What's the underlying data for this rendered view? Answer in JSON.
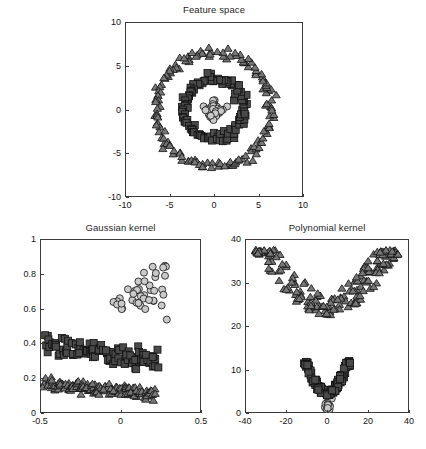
{
  "figure": {
    "width": 426,
    "height": 449,
    "background": "#ffffff"
  },
  "style": {
    "circle_fill": "#c9c9c9",
    "square_fill": "#4a4a4a",
    "triangle_fill": "#777777",
    "marker_edge": "#111111",
    "axis_color": "#3a3a3a",
    "text_color": "#141414"
  },
  "chart_data": [
    {
      "id": "feature-space",
      "type": "scatter",
      "title": "Feature space",
      "xlabel": "",
      "ylabel": "",
      "xlim": [
        -10,
        10
      ],
      "ylim": [
        -10,
        10
      ],
      "xticks": [
        -10,
        -5,
        0,
        5,
        10
      ],
      "yticks": [
        -10,
        -5,
        0,
        5,
        10
      ],
      "xticklabels": [
        "-10",
        "-5",
        "0",
        "5",
        "10"
      ],
      "yticklabels": [
        "-10",
        "-5",
        "0",
        "5",
        "10"
      ],
      "grid": false,
      "legend": "none",
      "description": "Three concentric ring clusters in 2-D feature space: an inner disc of circles, a middle annulus of squares, and an outer annulus of triangles.",
      "series": [
        {
          "name": "class-1",
          "marker": "circle",
          "fill": "#c9c9c9",
          "n": 40,
          "shape": "disc",
          "center": [
            0,
            0
          ],
          "radius_mean": 0.95,
          "radius_spread": 0.75,
          "seed": 11
        },
        {
          "name": "class-2",
          "marker": "square",
          "fill": "#4a4a4a",
          "n": 110,
          "shape": "ring",
          "center": [
            0,
            0
          ],
          "radius_mean": 3.4,
          "radius_spread": 0.55,
          "seed": 27
        },
        {
          "name": "class-3",
          "marker": "triangle",
          "fill": "#777777",
          "n": 150,
          "shape": "ring",
          "center": [
            0,
            0
          ],
          "radius_mean": 6.5,
          "radius_spread": 0.55,
          "seed": 43
        }
      ]
    },
    {
      "id": "gaussian-kernel",
      "type": "scatter",
      "title": "Gaussian kernel",
      "xlabel": "",
      "ylabel": "",
      "xlim": [
        -0.5,
        0.5
      ],
      "ylim": [
        0,
        1
      ],
      "xticks": [
        -0.5,
        0,
        0.5
      ],
      "yticks": [
        0,
        0.2,
        0.4,
        0.6,
        0.8,
        1
      ],
      "xticklabels": [
        "-0.5",
        "0",
        "0.5"
      ],
      "yticklabels": [
        "0",
        "0.2",
        "0.4",
        "0.6",
        "0.8",
        "1"
      ],
      "grid": false,
      "legend": "none",
      "description": "Kernel PCA projection with a Gaussian (RBF) kernel. The three classes separate into three horizontal bands: circles high (around 0.6-0.85) forming a fan, squares in a mid band (around 0.3-0.4), triangles in a low band (around 0.1-0.17).",
      "series": [
        {
          "name": "class-1",
          "marker": "circle",
          "fill": "#c9c9c9",
          "n": 40,
          "shape": "fan",
          "x_range": [
            -0.09,
            0.29
          ],
          "y_base": 0.595,
          "y_slope": 0.62,
          "y_jitter": 0.045,
          "seed": 5
        },
        {
          "name": "class-2",
          "marker": "square",
          "fill": "#4a4a4a",
          "n": 110,
          "shape": "band",
          "x_range": [
            -0.47,
            0.23
          ],
          "y_base": 0.392,
          "y_slope": -0.13,
          "y_jitter": 0.03,
          "seed": 17
        },
        {
          "name": "class-3",
          "marker": "triangle",
          "fill": "#777777",
          "n": 150,
          "shape": "band",
          "x_range": [
            -0.47,
            0.21
          ],
          "y_base": 0.168,
          "y_slope": -0.08,
          "y_jitter": 0.018,
          "seed": 31
        }
      ]
    },
    {
      "id": "polynomial-kernel",
      "type": "scatter",
      "title": "Polynomial kernel",
      "xlabel": "",
      "ylabel": "",
      "xlim": [
        -40,
        40
      ],
      "ylim": [
        0,
        40
      ],
      "xticks": [
        -40,
        -20,
        0,
        20,
        40
      ],
      "yticks": [
        0,
        10,
        20,
        30,
        40
      ],
      "xticklabels": [
        "-40",
        "-20",
        "0",
        "20",
        "40"
      ],
      "yticklabels": [
        "0",
        "10",
        "20",
        "30",
        "40"
      ],
      "grid": false,
      "legend": "none",
      "description": "Kernel PCA projection with a polynomial kernel. Triangles form a wide arc band spanning roughly -35 to 35 in x at y 23-38; squares form a narrow downward bowl near x 0 at y 4-12; circles form a tiny tight clump near the origin at y 0-4.",
      "series": [
        {
          "name": "class-1",
          "marker": "circle",
          "fill": "#c9c9c9",
          "n": 16,
          "shape": "clump",
          "center": [
            0.5,
            1.6
          ],
          "spread_x": 2.0,
          "spread_y": 1.5,
          "seed": 7
        },
        {
          "name": "class-2",
          "marker": "square",
          "fill": "#4a4a4a",
          "n": 110,
          "shape": "bowl",
          "x_half": 11.5,
          "y_top": 12.0,
          "depth": 8.0,
          "thickness": 2.0,
          "seed": 23
        },
        {
          "name": "class-3",
          "marker": "triangle",
          "fill": "#777777",
          "n": 190,
          "shape": "bowl",
          "x_half": 35.0,
          "y_top": 37.5,
          "depth": 15.0,
          "thickness": 7.0,
          "seed": 53
        }
      ]
    }
  ],
  "panels": [
    {
      "id": "feature-space",
      "title": "Feature space",
      "frame": {
        "left": 125,
        "top": 22,
        "width": 178,
        "height": 175
      },
      "title_top": 4,
      "marker_size": 7.0
    },
    {
      "id": "gaussian-kernel",
      "title": "Gaussian kernel",
      "frame": {
        "left": 40,
        "top": 239,
        "width": 161,
        "height": 174
      },
      "title_top": 222,
      "marker_size": 7.0
    },
    {
      "id": "polynomial-kernel",
      "title": "Polynomial kernel",
      "frame": {
        "left": 245,
        "top": 239,
        "width": 164,
        "height": 174
      },
      "title_top": 222,
      "marker_size": 7.0
    }
  ]
}
